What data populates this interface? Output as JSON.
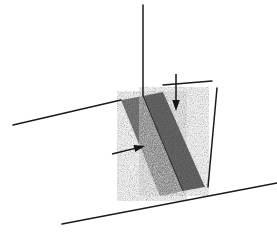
{
  "figure": {
    "background_color": "#ffffff",
    "line_color": "#1a1a1a",
    "band_fill_color": "#7d7d7d",
    "band_fill_color_dark": "#6a6a6a",
    "annotation_color": "#141414",
    "labels": {
      "vertical_axis": "",
      "horizontal_axis": "",
      "groove_label": "",
      "depth_arrow_label": "",
      "side_arrow_label": ""
    },
    "elements": {
      "vertical_line": "vertical-reference-line",
      "left_ground_line": "left-ground-line",
      "bottom_ground_line": "bottom-ground-line",
      "right_slant_line": "right-slant-line",
      "top_right_horizontal_line": "top-right-horizontal-line",
      "groove_face_near": "groove-near-face",
      "groove_face_far": "groove-far-face",
      "down_arrow": "down-arrow",
      "right_arrow": "right-arrow"
    }
  },
  "geometry": {
    "vertical_line": {
      "x1": 143,
      "y1": 5,
      "x2": 143,
      "y2": 96
    },
    "left_ground_line": {
      "x1": 13,
      "y1": 125,
      "x2": 121,
      "y2": 100
    },
    "bottom_ground_line": {
      "x1": 62,
      "y1": 224,
      "x2": 277,
      "y2": 183
    },
    "right_slant_line": {
      "x1": 217,
      "y1": 88,
      "x2": 208,
      "y2": 187
    },
    "top_right_horizontal_line": {
      "x1": 163,
      "y1": 85,
      "x2": 212,
      "y2": 81
    },
    "groove_near_face": [
      [
        121,
        100
      ],
      [
        143,
        96
      ],
      [
        183,
        191
      ],
      [
        160,
        196
      ]
    ],
    "groove_far_face": [
      [
        143,
        96
      ],
      [
        163,
        92
      ],
      [
        205,
        187
      ],
      [
        183,
        191
      ]
    ],
    "down_arrow": {
      "x1": 176,
      "y1": 74,
      "x2": 176,
      "y2": 111
    },
    "right_arrow": {
      "x1": 112,
      "y1": 154,
      "x2": 145,
      "y2": 146
    }
  },
  "meta": {
    "width_px": 277,
    "height_px": 233
  }
}
